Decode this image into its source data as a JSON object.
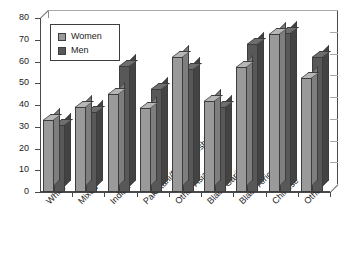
{
  "chart_data": {
    "type": "bar",
    "title": "",
    "subtitle": "",
    "xlabel": "",
    "ylabel": "",
    "ylim": [
      0,
      80
    ],
    "ytick_step": 10,
    "yticks": [
      "0",
      "10",
      "20",
      "30",
      "40",
      "50",
      "60",
      "70",
      "80"
    ],
    "grid": true,
    "legend_position": "top-left",
    "categories": [
      "White",
      "Mixed",
      "Indian",
      "Pakistani/Bangladeshi",
      "Other Asian",
      "Black Caribbean",
      "Black African",
      "Chinese",
      "Other"
    ],
    "series": [
      {
        "name": "Women",
        "color": "#9a9a9a",
        "values": [
          33,
          39,
          45,
          38.5,
          62,
          42,
          57.5,
          72.5,
          52.5
        ]
      },
      {
        "name": "Men",
        "color": "#585858",
        "values": [
          31,
          37,
          58,
          47.5,
          56.5,
          39,
          68,
          73,
          62
        ]
      }
    ]
  },
  "legend": {
    "items": [
      {
        "label": "Women"
      },
      {
        "label": "Men"
      }
    ]
  },
  "colors": {
    "women": "#9a9a9a",
    "men": "#585858",
    "axis": "#4a4a4a",
    "grid": "#a8a8a8",
    "text": "#1b1b1b",
    "background": "#ffffff"
  }
}
